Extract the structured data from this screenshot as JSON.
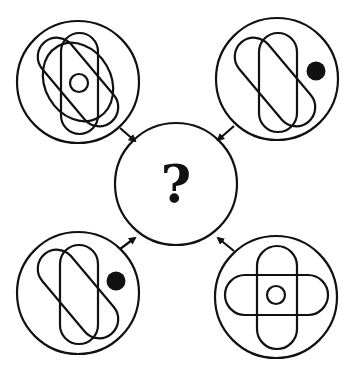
{
  "puzzle": {
    "type": "figure-combination",
    "question_symbol": "?",
    "stroke_color": "#111111",
    "background": "#ffffff",
    "panels": [
      {
        "position": "top-left",
        "description": "vertical capsule, diagonal capsule, large ellipse tilted, small center circle",
        "shapes": [
          "vertical-capsule",
          "diagonal-capsule",
          "tilted-ellipse",
          "small-circle"
        ]
      },
      {
        "position": "top-right",
        "description": "vertical capsule, diagonal capsule, filled dot on right",
        "shapes": [
          "vertical-capsule",
          "diagonal-capsule",
          "filled-dot"
        ]
      },
      {
        "position": "bottom-left",
        "description": "vertical capsule, diagonal capsule, filled dot on right",
        "shapes": [
          "vertical-capsule",
          "diagonal-capsule",
          "filled-dot"
        ]
      },
      {
        "position": "bottom-right",
        "description": "vertical capsule, horizontal capsule forming cross, small center circle",
        "shapes": [
          "vertical-capsule",
          "horizontal-capsule",
          "small-circle"
        ]
      }
    ],
    "center": {
      "position": "center",
      "label": "?"
    }
  }
}
